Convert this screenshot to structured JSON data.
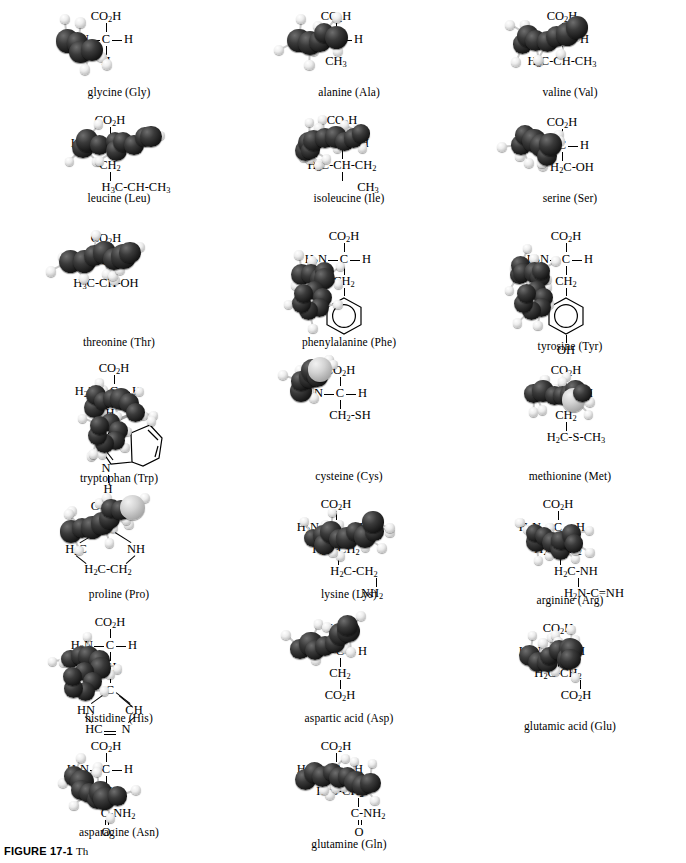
{
  "figure": {
    "label": "FIGURE 17-1",
    "trailing": "Th"
  },
  "amino_acids": [
    {
      "id": "glycine",
      "caption": "glycine (Gly)",
      "top": "CO2H",
      "left": "H2N",
      "center": "C",
      "right": "H",
      "chain": [
        "H"
      ],
      "side_type": "simple"
    },
    {
      "id": "alanine",
      "caption": "alanine (Ala)",
      "top": "CO2H",
      "left": "H2N",
      "center": "C",
      "right": "H",
      "chain": [
        "CH3"
      ],
      "side_type": "simple"
    },
    {
      "id": "valine",
      "caption": "valine (Val)",
      "top": "CO2H",
      "left": "H2N",
      "center": "C",
      "right": "H",
      "chain": [
        "H3C-CH-CH3"
      ],
      "side_type": "branched"
    },
    {
      "id": "leucine",
      "caption": "leucine (Leu)",
      "top": "CO2H",
      "left": "H2N",
      "center": "C",
      "right": "H",
      "chain": [
        "CH2",
        "H3C-CH-CH3"
      ],
      "side_type": "branched"
    },
    {
      "id": "isoleucine",
      "caption": "isoleucine (Ile)",
      "top": "CO2H",
      "left": "H2N",
      "center": "C",
      "right": "H",
      "chain": [
        "H3C-CH-CH2",
        "CH3"
      ],
      "side_type": "branched"
    },
    {
      "id": "serine",
      "caption": "serine (Ser)",
      "top": "CO2H",
      "left": "H2N",
      "center": "C",
      "right": "H",
      "chain": [
        "H2C-OH"
      ],
      "side_type": "simple"
    },
    {
      "id": "threonine",
      "caption": "threonine (Thr)",
      "top": "CO2H",
      "left": "H2N",
      "center": "C",
      "right": "H",
      "chain": [
        "H3C-CH-OH"
      ],
      "side_type": "branched"
    },
    {
      "id": "phenylalanine",
      "caption": "phenylalanine (Phe)",
      "top": "CO2H",
      "left": "H2N",
      "center": "C",
      "right": "H",
      "chain": [
        "CH2"
      ],
      "side_type": "benzene"
    },
    {
      "id": "tyrosine",
      "caption": "tyrosine (Tyr)",
      "top": "CO2H",
      "left": "H2N",
      "center": "C",
      "right": "H",
      "chain": [
        "CH2"
      ],
      "side_type": "phenol",
      "ring_substituent": "OH"
    },
    {
      "id": "tryptophan",
      "caption": "tryptophan (Trp)",
      "top": "CO2H",
      "left": "H2N",
      "center": "C",
      "right": "H",
      "chain": [
        "CH2"
      ],
      "side_type": "indole",
      "ring_nh": "N",
      "ring_nh_h": "H"
    },
    {
      "id": "cysteine",
      "caption": "cysteine (Cys)",
      "top": "CO2H",
      "left": "H2N",
      "center": "C",
      "right": "H",
      "chain": [
        "CH2-SH"
      ],
      "side_type": "simple"
    },
    {
      "id": "methionine",
      "caption": "methionine (Met)",
      "top": "CO2H",
      "left": "H2N",
      "center": "C",
      "right": "H",
      "chain": [
        "CH2",
        "H2C-S-CH3"
      ],
      "side_type": "simple"
    },
    {
      "id": "proline",
      "caption": "proline (Pro)",
      "top": "CO2H",
      "side_type": "pyrrolidine",
      "ring_tokens": [
        "CH",
        "H2C",
        "NH",
        "H2C-CH2"
      ]
    },
    {
      "id": "lysine",
      "caption": "lysine (Lys)",
      "top": "CO2H",
      "left": "H2N",
      "center": "C",
      "right": "H",
      "chain": [
        "H2C-CH2",
        "H2C-CH2",
        "NH2"
      ],
      "side_type": "zigzag"
    },
    {
      "id": "arginine",
      "caption": "arginine (Arg)",
      "top": "CO2H",
      "left": "H2N",
      "center": "C",
      "right": "H",
      "chain": [
        "H2C-CH2",
        "H2C-NH",
        "H2N-C=NH"
      ],
      "side_type": "zigzag"
    },
    {
      "id": "histidine",
      "caption": "histidine (His)",
      "top": "CO2H",
      "left": "H2N",
      "center": "C",
      "right": "H",
      "chain": [
        "CH2"
      ],
      "side_type": "imidazole",
      "ring_tokens": [
        "C",
        "HN",
        "CH",
        "HC",
        "N"
      ]
    },
    {
      "id": "aspartic-acid",
      "caption": "aspartic acid (Asp)",
      "top": "CO2H",
      "left": "H2N",
      "center": "C",
      "right": "H",
      "chain": [
        "CH2",
        "CO2H"
      ],
      "side_type": "simple"
    },
    {
      "id": "glutamic-acid",
      "caption": "glutamic acid (Glu)",
      "top": "CO2H",
      "left": "H2N",
      "center": "C",
      "right": "H",
      "chain": [
        "H2C-CH2",
        "CO2H"
      ],
      "side_type": "zigzag"
    },
    {
      "id": "asparagine",
      "caption": "asparagine (Asn)",
      "top": "CO2H",
      "left": "H2N",
      "center": "C",
      "right": "H",
      "chain": [
        "CH2",
        "C-NH2",
        "O"
      ],
      "side_type": "amide"
    },
    {
      "id": "glutamine",
      "caption": "glutamine (Gln)",
      "top": "CO2H",
      "left": "H2N",
      "center": "C",
      "right": "H",
      "chain": [
        "H2C-CH2",
        "C-NH2",
        "O"
      ],
      "side_type": "amide"
    }
  ],
  "colors": {
    "carbon": "#1a1a1a",
    "hydrogen": "#e8e8e8",
    "sulfur": "#cccccc",
    "background": "#ffffff",
    "bond": "#9d9d9d"
  }
}
